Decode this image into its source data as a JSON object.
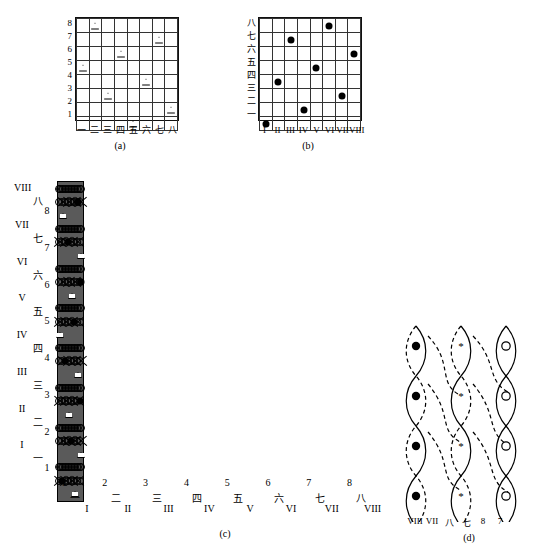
{
  "figure": {
    "captions": {
      "a": "(a)",
      "b": "(b)",
      "c": "(c)",
      "d": "(d)"
    }
  },
  "labels": {
    "arabic": [
      "1",
      "2",
      "3",
      "4",
      "5",
      "6",
      "7",
      "8"
    ],
    "chinese": [
      "一",
      "二",
      "三",
      "四",
      "五",
      "六",
      "七",
      "八"
    ],
    "roman": [
      "I",
      "II",
      "III",
      "IV",
      "V",
      "VI",
      "VII",
      "VIII"
    ]
  },
  "panel_a": {
    "caption": "(a)",
    "rows": 8,
    "cols": 8,
    "row_labels_top_to_bottom": [
      "8",
      "7",
      "6",
      "5",
      "4",
      "3",
      "2",
      "1"
    ],
    "col_labels_left_to_right": [
      "一",
      "二",
      "三",
      "四",
      "五",
      "六",
      "七",
      "八"
    ],
    "marker": "triangle",
    "marks_row_to_col": {
      "8": 2,
      "7": 7,
      "6": 4,
      "5": 1,
      "4": 6,
      "3": 3,
      "2": 8,
      "1": 5
    }
  },
  "panel_b": {
    "caption": "(b)",
    "rows": 8,
    "cols": 8,
    "row_labels_top_to_bottom": [
      "八",
      "七",
      "六",
      "五",
      "四",
      "三",
      "二",
      "一"
    ],
    "col_labels_left_to_right": [
      "I",
      "II",
      "III",
      "IV",
      "V",
      "VI",
      "VII",
      "VIII"
    ],
    "marker": "filled-dot",
    "marks_row_to_col": {
      "八": 6,
      "七": 3,
      "六": 8,
      "五": 5,
      "四": 2,
      "三": 7,
      "二": 4,
      "一": 1
    }
  },
  "panel_c": {
    "caption": "(c)",
    "rows": 24,
    "cols": 24,
    "left_labels_roman_top_to_bottom": [
      "VIII",
      "VII",
      "VI",
      "V",
      "IV",
      "III",
      "II",
      "I"
    ],
    "left_labels_chinese_top_to_bottom": [
      "八",
      "七",
      "六",
      "五",
      "四",
      "三",
      "二",
      "一"
    ],
    "left_labels_arabic_top_to_bottom": [
      "8",
      "7",
      "6",
      "5",
      "4",
      "3",
      "2",
      "1"
    ],
    "bottom_labels_arabic": [
      "1",
      "2",
      "3",
      "4",
      "5",
      "6",
      "7",
      "8"
    ],
    "bottom_labels_chinese": [
      "一",
      "二",
      "三",
      "四",
      "五",
      "六",
      "七",
      "八"
    ],
    "bottom_labels_roman": [
      "I",
      "II",
      "III",
      "IV",
      "V",
      "VI",
      "VII",
      "VIII"
    ],
    "cell_types": {
      "circle": "open-circle",
      "cross": "x-mark",
      "black": "filled-black-cell",
      "gray": "gray-cell",
      "dot": "filled-dot",
      "triangle": "open-triangle",
      "empty": "blank"
    },
    "module_period_rows": 3,
    "module_period_cols": 3,
    "dot_marks": [
      {
        "row": 2,
        "col": 20
      },
      {
        "row": 5,
        "col": 10
      },
      {
        "row": 8,
        "col": 23
      },
      {
        "row": 11,
        "col": 16
      },
      {
        "row": 14,
        "col": 7
      },
      {
        "row": 17,
        "col": 22
      },
      {
        "row": 20,
        "col": 13
      },
      {
        "row": 23,
        "col": 4
      }
    ],
    "triangle_marks": [
      {
        "row": 3,
        "col": 5
      },
      {
        "row": 6,
        "col": 23
      },
      {
        "row": 9,
        "col": 14
      },
      {
        "row": 12,
        "col": 2
      },
      {
        "row": 15,
        "col": 20
      },
      {
        "row": 18,
        "col": 11
      },
      {
        "row": 21,
        "col": 23
      },
      {
        "row": 24,
        "col": 17
      }
    ]
  },
  "panel_d": {
    "caption": "(d)",
    "strand_labels": [
      "VIII",
      "VII",
      "八",
      "七",
      "8",
      "7"
    ],
    "marker_left": "filled-dot",
    "marker_middle": "asterisk",
    "marker_right": "open-circle",
    "dot_count_left": 4,
    "star_count_middle": 4,
    "circle_count_right": 4
  },
  "colors": {
    "line": "#000000",
    "gray_cell": "#8f8f8f",
    "black_cell": "#000000",
    "background": "#ffffff",
    "grid_line": "#5a5a5a"
  }
}
